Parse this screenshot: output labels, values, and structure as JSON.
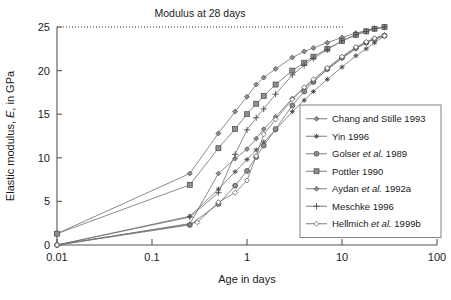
{
  "chart_data": {
    "type": "line",
    "title": "Modulus at 28 days",
    "xlabel": "Age in days",
    "ylabel_parts": {
      "pre": "Elastic modulus, ",
      "italic": "E",
      "post": ", in GPa"
    },
    "ylabel": "Elastic modulus, E, in GPa",
    "xscale": "log",
    "yscale": "linear",
    "xlim": [
      0.01,
      100
    ],
    "ylim": [
      0,
      25
    ],
    "xticks": [
      "0.01",
      "0.1",
      "1",
      "10",
      "100"
    ],
    "xtick_values": [
      0.01,
      0.1,
      1,
      10,
      100
    ],
    "yticks": [
      "0",
      "5",
      "10",
      "15",
      "20",
      "25"
    ],
    "ytick_values": [
      0,
      5,
      10,
      15,
      20,
      25
    ],
    "grid": false,
    "legend_position": "lower-right-inside",
    "annotations": [
      {
        "text": "Modulus at 28 days",
        "y_value": 25,
        "style": "dotted-horizontal-reference-line"
      }
    ],
    "series": [
      {
        "name": "Chang and Stille 1993",
        "marker": "diamond",
        "x": [
          0.01,
          0.25,
          0.5,
          0.75,
          1.0,
          1.25,
          1.5,
          2.0,
          3.0,
          4.0,
          5.0,
          7.0,
          10.0,
          14.0,
          18.0,
          22.0,
          28.0
        ],
        "y": [
          1.3,
          8.2,
          12.8,
          15.3,
          17.0,
          18.4,
          19.2,
          20.2,
          21.5,
          22.2,
          22.6,
          23.2,
          23.8,
          24.3,
          24.6,
          24.8,
          25.0
        ]
      },
      {
        "name": "Yin 1996",
        "marker": "star",
        "x": [
          0.01,
          0.25,
          0.5,
          0.75,
          1.0,
          1.25,
          1.5,
          2.0,
          3.0,
          4.0,
          5.0,
          7.0,
          10.0,
          14.0,
          18.0,
          22.0,
          28.0
        ],
        "y": [
          0.0,
          3.3,
          6.4,
          8.4,
          9.8,
          10.9,
          11.8,
          13.2,
          15.3,
          16.6,
          17.6,
          19.0,
          20.4,
          21.7,
          22.5,
          23.2,
          24.0
        ]
      },
      {
        "name": "Golser et al. 1989",
        "marker": "circle",
        "x": [
          0.01,
          0.25,
          0.5,
          0.75,
          1.0,
          1.25,
          1.5,
          2.0,
          3.0,
          4.0,
          5.0,
          7.0,
          10.0,
          14.0,
          18.0,
          22.0,
          28.0
        ],
        "y": [
          0.0,
          2.3,
          4.7,
          6.8,
          8.5,
          10.1,
          11.4,
          13.3,
          16.0,
          17.6,
          18.7,
          20.2,
          21.5,
          22.6,
          23.2,
          23.6,
          24.0
        ]
      },
      {
        "name": "Pottler 1990",
        "marker": "square",
        "x": [
          0.01,
          0.25,
          0.5,
          0.75,
          1.0,
          1.25,
          1.5,
          2.0,
          3.0,
          4.0,
          5.0,
          7.0,
          10.0,
          14.0,
          18.0,
          22.0,
          28.0
        ],
        "y": [
          1.3,
          6.9,
          11.1,
          13.3,
          15.0,
          16.2,
          17.1,
          18.4,
          20.0,
          20.9,
          21.6,
          22.5,
          23.4,
          24.1,
          24.5,
          24.8,
          25.0
        ]
      },
      {
        "name": "Aydan et al. 1992a",
        "marker": "diamond-small",
        "x": [
          0.01,
          0.25,
          0.5,
          0.75,
          1.0,
          1.25,
          1.5,
          2.0,
          3.0,
          4.0,
          5.0,
          7.0,
          10.0,
          14.0,
          18.0,
          22.0,
          28.0
        ],
        "y": [
          0.0,
          2.4,
          8.2,
          9.9,
          11.0,
          12.2,
          13.3,
          14.7,
          16.8,
          18.0,
          18.8,
          20.1,
          21.4,
          22.5,
          23.2,
          23.7,
          24.1
        ]
      },
      {
        "name": "Meschke 1996",
        "marker": "plus",
        "x": [
          0.01,
          0.25,
          0.5,
          0.75,
          1.0,
          1.25,
          1.5,
          2.0,
          3.0,
          4.0,
          5.0,
          7.0,
          10.0,
          14.0,
          18.0,
          22.0,
          28.0
        ],
        "y": [
          0.0,
          3.2,
          6.0,
          10.4,
          13.2,
          14.6,
          15.6,
          17.3,
          19.5,
          20.6,
          21.4,
          22.4,
          23.4,
          24.1,
          24.5,
          24.8,
          25.0
        ]
      },
      {
        "name": "Hellmich et al. 1999b",
        "marker": "diamond-open",
        "x": [
          0.01,
          0.3,
          0.5,
          0.75,
          1.0,
          1.25,
          1.5,
          2.0,
          3.0,
          4.0,
          5.0,
          7.0,
          10.0,
          14.0,
          18.0,
          22.0,
          28.0
        ],
        "y": [
          0.0,
          2.6,
          4.9,
          6.0,
          7.4,
          10.2,
          12.7,
          14.4,
          16.7,
          18.1,
          19.0,
          20.3,
          21.6,
          22.7,
          23.3,
          23.7,
          24.0
        ]
      }
    ],
    "legend": [
      {
        "label_plain": "Chang and Stille 1993",
        "pre": "Chang and Stille 1993",
        "italic": "",
        "post": ""
      },
      {
        "label_plain": "Yin 1996",
        "pre": "Yin 1996",
        "italic": "",
        "post": ""
      },
      {
        "label_plain": "Golser et al. 1989",
        "pre": "Golser ",
        "italic": "et al.",
        "post": " 1989"
      },
      {
        "label_plain": "Pottler 1990",
        "pre": "Pottler 1990",
        "italic": "",
        "post": ""
      },
      {
        "label_plain": "Aydan et al. 1992a",
        "pre": "Aydan ",
        "italic": "et al.",
        "post": " 1992a"
      },
      {
        "label_plain": "Meschke 1996",
        "pre": "Meschke 1996",
        "italic": "",
        "post": ""
      },
      {
        "label_plain": "Hellmich et al. 1999b",
        "pre": "Hellmich ",
        "italic": "et al.",
        "post": " 1999b"
      }
    ],
    "colors": {
      "line": "#6e6e6e",
      "marker_fill": "#8d8d8d",
      "marker_stroke": "#4a4a4a",
      "axis": "#555555",
      "text": "#1a1a1a",
      "background": "#ffffff"
    }
  }
}
